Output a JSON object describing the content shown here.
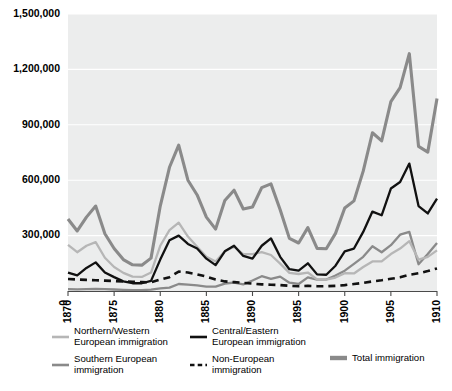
{
  "chart_data": {
    "type": "line",
    "title": "",
    "xlabel": "",
    "ylabel": "",
    "xlim": [
      1870,
      1910
    ],
    "ylim": [
      0,
      1500000
    ],
    "grid": true,
    "legend_position": "bottom",
    "x_tick_labels": [
      "1870",
      "1875",
      "1880",
      "1885",
      "1890",
      "1895",
      "1900",
      "1905",
      "1910"
    ],
    "x_ticks": [
      1870,
      1875,
      1880,
      1885,
      1890,
      1895,
      1900,
      1905,
      1910
    ],
    "y_tick_labels": [
      "0",
      "300,000",
      "600,000",
      "900,000",
      "1,200,000",
      "1,500,000"
    ],
    "y_ticks": [
      0,
      300000,
      600000,
      900000,
      1200000,
      1500000
    ],
    "x": [
      1870,
      1871,
      1872,
      1873,
      1874,
      1875,
      1876,
      1877,
      1878,
      1879,
      1880,
      1881,
      1882,
      1883,
      1884,
      1885,
      1886,
      1887,
      1888,
      1889,
      1890,
      1891,
      1892,
      1893,
      1894,
      1895,
      1896,
      1897,
      1898,
      1899,
      1900,
      1901,
      1902,
      1903,
      1904,
      1905,
      1906,
      1907,
      1908,
      1909,
      1910
    ],
    "series": [
      {
        "name": "Total immigration",
        "key": "total",
        "color": "#8a8a8a",
        "width": 3.1,
        "dash": "",
        "values": [
          390000,
          325000,
          400000,
          460000,
          310000,
          230000,
          170000,
          142000,
          140000,
          178000,
          460000,
          670000,
          790000,
          600000,
          520000,
          400000,
          335000,
          490000,
          546000,
          444000,
          455000,
          560000,
          580000,
          440000,
          285000,
          260000,
          343000,
          231000,
          229000,
          312000,
          449000,
          488000,
          649000,
          857000,
          813000,
          1026000,
          1101000,
          1285000,
          783000,
          752000,
          1042000
        ]
      },
      {
        "name": "Northern/Western European immigration",
        "key": "northern_western",
        "color": "#b6b6b6",
        "width": 2.3,
        "dash": "",
        "values": [
          250000,
          210000,
          245000,
          265000,
          180000,
          130000,
          98000,
          78000,
          76000,
          100000,
          245000,
          330000,
          370000,
          295000,
          240000,
          185000,
          160000,
          215000,
          240000,
          200000,
          200000,
          210000,
          195000,
          148000,
          98000,
          92000,
          100000,
          63000,
          62000,
          73000,
          96000,
          95000,
          130000,
          160000,
          160000,
          200000,
          230000,
          270000,
          170000,
          185000,
          220000
        ]
      },
      {
        "name": "Southern European immigration",
        "key": "southern",
        "color": "#8a8a8a",
        "width": 2.3,
        "dash": "",
        "values": [
          10000,
          9000,
          10000,
          12000,
          10000,
          8000,
          6000,
          5000,
          5000,
          7000,
          14000,
          18000,
          38000,
          34000,
          30000,
          24000,
          24000,
          40000,
          46000,
          36000,
          57000,
          80000,
          66000,
          78000,
          45000,
          38000,
          74000,
          62000,
          62000,
          84000,
          110000,
          147000,
          185000,
          242000,
          210000,
          248000,
          305000,
          320000,
          145000,
          200000,
          260000
        ]
      },
      {
        "name": "Central/Eastern European immigration",
        "key": "central_eastern",
        "color": "#111111",
        "width": 2.3,
        "dash": "",
        "values": [
          100000,
          85000,
          125000,
          155000,
          100000,
          75000,
          52000,
          42000,
          42000,
          55000,
          170000,
          275000,
          300000,
          255000,
          230000,
          175000,
          140000,
          215000,
          245000,
          190000,
          175000,
          245000,
          285000,
          185000,
          118000,
          110000,
          150000,
          90000,
          88000,
          137000,
          215000,
          230000,
          320000,
          430000,
          410000,
          555000,
          590000,
          690000,
          460000,
          420000,
          500000
        ]
      },
      {
        "name": "Non-European immigration",
        "key": "non_european",
        "color": "#111111",
        "width": 2.6,
        "dash": "7,5",
        "values": [
          65000,
          62000,
          60000,
          58000,
          56000,
          54000,
          52000,
          50000,
          48000,
          47000,
          62000,
          75000,
          105000,
          100000,
          90000,
          78000,
          62000,
          52000,
          48000,
          44000,
          40000,
          36000,
          34000,
          32000,
          28000,
          26000,
          28000,
          26000,
          26000,
          28000,
          32000,
          38000,
          44000,
          52000,
          58000,
          66000,
          74000,
          88000,
          96000,
          108000,
          122000
        ]
      }
    ]
  },
  "legend": {
    "entries": [
      {
        "label_line1": "Northern/Western",
        "label_line2": "European immigration",
        "series_key": "northern_western",
        "swatch_color": "#b6b6b6",
        "swatch_dashed": false
      },
      {
        "label_line1": "Southern European",
        "label_line2": "immigration",
        "series_key": "southern",
        "swatch_color": "#8a8a8a",
        "swatch_dashed": false
      },
      {
        "label_line1": "Central/Eastern",
        "label_line2": "European immigration",
        "series_key": "central_eastern",
        "swatch_color": "#111111",
        "swatch_dashed": false
      },
      {
        "label_line1": "Non-European",
        "label_line2": "immigration",
        "series_key": "non_european",
        "swatch_color": "#111111",
        "swatch_dashed": true
      },
      {
        "label_line1": "Total immigration",
        "label_line2": "",
        "series_key": "total",
        "swatch_color": "#8a8a8a",
        "swatch_dashed": false
      }
    ]
  },
  "colors": {
    "plot_background": "#eceded",
    "gridline": "#ffffff",
    "axis": "#4a4a4a",
    "page_background": "#ffffff"
  }
}
